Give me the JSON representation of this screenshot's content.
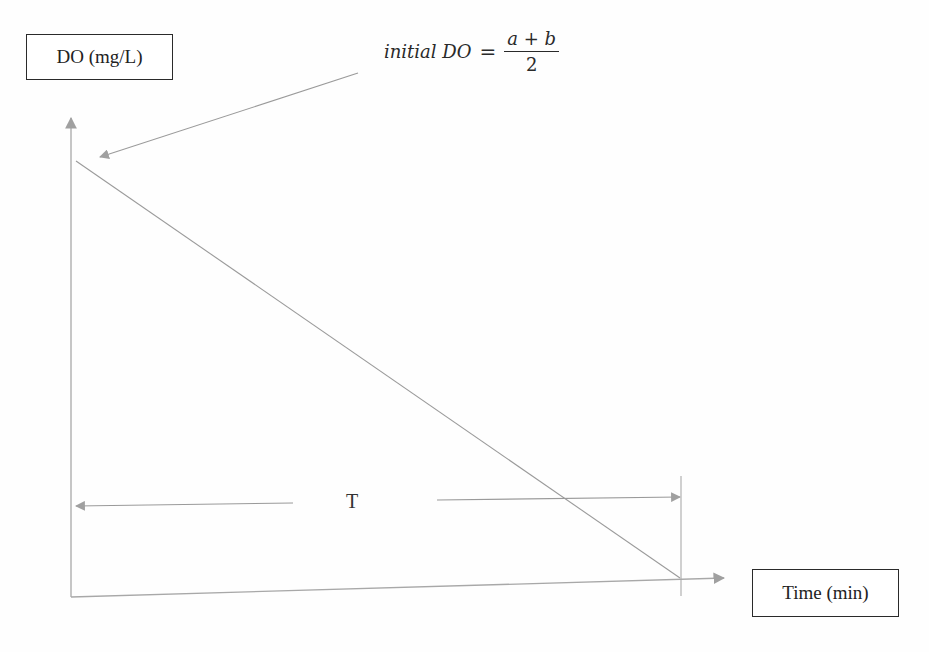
{
  "diagram": {
    "y_axis_label": "DO (mg/L)",
    "x_axis_label": "Time (min)",
    "duration_label": "T",
    "annotation": {
      "lhs": "initial DO",
      "equals": "=",
      "numerator": "a + b",
      "denominator": "2"
    },
    "colors": {
      "line": "#9a9a9a",
      "arrowhead": "#a0a0a0",
      "box_border": "#2a2a2a",
      "text": "#222222"
    }
  }
}
